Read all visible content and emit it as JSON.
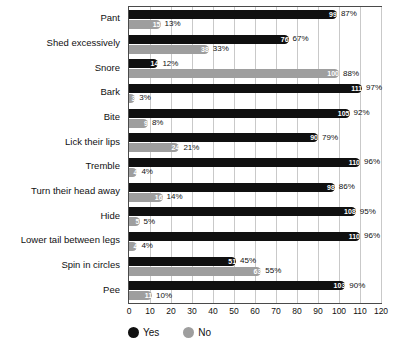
{
  "chart_data": {
    "type": "bar",
    "orientation": "horizontal",
    "title": "",
    "subtitle": "",
    "xlabel": "",
    "ylabel": "",
    "xlim": [
      0,
      120
    ],
    "xticks": [
      "0",
      "10",
      "20",
      "30",
      "40",
      "50",
      "60",
      "70",
      "80",
      "90",
      "100",
      "110",
      "120"
    ],
    "grid": true,
    "legend_position": "bottom-left",
    "legend": [
      {
        "name": "Yes",
        "color": "#101010"
      },
      {
        "name": "No",
        "color": "#9e9e9e"
      }
    ],
    "categories": [
      "Pant",
      "Shed excessively",
      "Snore",
      "Bark",
      "Bite",
      "Lick their lips",
      "Tremble",
      "Turn their head away",
      "Hide",
      "Lower tail between legs",
      "Spin in circles",
      "Pee"
    ],
    "series": [
      {
        "name": "Yes",
        "color": "#101010",
        "values": [
          99,
          76,
          14,
          111,
          105,
          90,
          110,
          98,
          108,
          110,
          51,
          103
        ],
        "percent_labels": [
          "87%",
          "67%",
          "12%",
          "97%",
          "92%",
          "79%",
          "96%",
          "86%",
          "95%",
          "96%",
          "45%",
          "90%"
        ]
      },
      {
        "name": "No",
        "color": "#9e9e9e",
        "values": [
          15,
          38,
          100,
          3,
          9,
          24,
          4,
          16,
          5,
          4,
          63,
          11
        ],
        "percent_labels": [
          "13%",
          "33%",
          "88%",
          "3%",
          "8%",
          "21%",
          "4%",
          "14%",
          "5%",
          "4%",
          "55%",
          "10%"
        ]
      }
    ]
  }
}
